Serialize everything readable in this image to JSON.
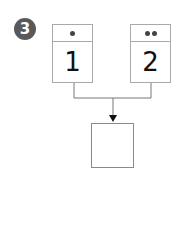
{
  "problem": {
    "number": "3",
    "badge_color": "#58595b"
  },
  "cards": [
    {
      "dots": 1,
      "value": "1"
    },
    {
      "dots": 2,
      "value": "2"
    }
  ],
  "answer_box": {
    "value": ""
  },
  "colors": {
    "card_border": "#a9a9a9",
    "line": "#777777",
    "arrow": "#111111"
  }
}
